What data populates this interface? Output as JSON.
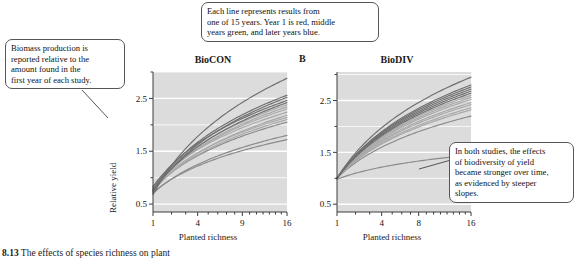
{
  "figure": {
    "caption_number": "8.13",
    "caption_text": "The effects of species richness on plant"
  },
  "callouts": [
    {
      "id": "biomass-note",
      "lines": [
        "Biomass production is",
        "reported relative to the",
        "amount found in the",
        "first year of each study."
      ]
    },
    {
      "id": "line-color-note",
      "lines": [
        "Each line represents results from",
        "one of 15 years. Year 1 is red, middle",
        "years green, and later years blue."
      ]
    },
    {
      "id": "slope-note",
      "lines": [
        "In both studies, the effects",
        "of biodiversity of yield",
        "became stronger over time,",
        "as evidenced by steeper",
        "slopes."
      ]
    }
  ],
  "colors": {
    "panel_background": "#dcdcdc",
    "gridline": "#ffffff",
    "axis": "#3c3c3c",
    "year_early": "#8a8a8a",
    "year_middle": "#a8a8a8",
    "year_late": "#6e6e6e"
  },
  "chart_data": [
    {
      "type": "line",
      "panel_letter": "A",
      "title": "BioCON",
      "xlabel": "Planted richness",
      "ylabel": "Relative yield",
      "x_ticks": [
        1,
        4,
        9,
        16
      ],
      "x_tick_labels": [
        "1",
        "4",
        "9",
        "16"
      ],
      "y_ticks": [
        0.5,
        1.5,
        2.5
      ],
      "y_tick_labels": [
        "0.5",
        "1.5",
        "2.5"
      ],
      "xlim": [
        1,
        16
      ],
      "ylim": [
        0.35,
        3.0
      ],
      "x_scale": "sqrt",
      "grid": true,
      "legend": "none",
      "n_years": 15,
      "series": [
        {
          "name": "Year 1",
          "color_group": "early",
          "y_at_x1": 0.72,
          "y_at_x16": 1.72
        },
        {
          "name": "Year 2",
          "color_group": "early",
          "y_at_x1": 0.7,
          "y_at_x16": 1.8
        },
        {
          "name": "Year 3",
          "color_group": "early",
          "y_at_x1": 0.78,
          "y_at_x16": 2.05
        },
        {
          "name": "Year 4",
          "color_group": "middle",
          "y_at_x1": 0.76,
          "y_at_x16": 2.1
        },
        {
          "name": "Year 5",
          "color_group": "middle",
          "y_at_x1": 0.8,
          "y_at_x16": 2.14
        },
        {
          "name": "Year 6",
          "color_group": "middle",
          "y_at_x1": 0.74,
          "y_at_x16": 2.18
        },
        {
          "name": "Year 7",
          "color_group": "middle",
          "y_at_x1": 0.82,
          "y_at_x16": 2.24
        },
        {
          "name": "Year 8",
          "color_group": "middle",
          "y_at_x1": 0.79,
          "y_at_x16": 2.3
        },
        {
          "name": "Year 9",
          "color_group": "middle",
          "y_at_x1": 0.77,
          "y_at_x16": 2.34
        },
        {
          "name": "Year 10",
          "color_group": "middle",
          "y_at_x1": 0.81,
          "y_at_x16": 2.38
        },
        {
          "name": "Year 11",
          "color_group": "late",
          "y_at_x1": 0.75,
          "y_at_x16": 2.42
        },
        {
          "name": "Year 12",
          "color_group": "late",
          "y_at_x1": 0.83,
          "y_at_x16": 2.46
        },
        {
          "name": "Year 13",
          "color_group": "late",
          "y_at_x1": 0.73,
          "y_at_x16": 2.52
        },
        {
          "name": "Year 14",
          "color_group": "late",
          "y_at_x1": 0.78,
          "y_at_x16": 2.56
        },
        {
          "name": "Year 15",
          "color_group": "late",
          "y_at_x1": 0.68,
          "y_at_x16": 2.88
        }
      ]
    },
    {
      "type": "line",
      "panel_letter": "B",
      "title": "BioDIV",
      "xlabel": "Planted richness",
      "ylabel": "",
      "x_ticks": [
        1,
        4,
        8,
        16
      ],
      "x_tick_labels": [
        "1",
        "4",
        "8",
        "16"
      ],
      "y_ticks": [
        0.5,
        1.5,
        2.5
      ],
      "y_tick_labels": [
        "0.5",
        "1.5",
        "2.5"
      ],
      "xlim": [
        1,
        16
      ],
      "ylim": [
        0.35,
        3.05
      ],
      "x_scale": "sqrt",
      "grid": true,
      "legend": "none",
      "n_years": 15,
      "series": [
        {
          "name": "Year 1",
          "color_group": "early",
          "y_at_x1": 0.98,
          "y_at_x16": 1.45
        },
        {
          "name": "Year 2",
          "color_group": "early",
          "y_at_x1": 1.0,
          "y_at_x16": 2.2
        },
        {
          "name": "Year 3",
          "color_group": "middle",
          "y_at_x1": 1.0,
          "y_at_x16": 2.32
        },
        {
          "name": "Year 4",
          "color_group": "middle",
          "y_at_x1": 1.0,
          "y_at_x16": 2.36
        },
        {
          "name": "Year 5",
          "color_group": "middle",
          "y_at_x1": 1.0,
          "y_at_x16": 2.42
        },
        {
          "name": "Year 6",
          "color_group": "middle",
          "y_at_x1": 1.0,
          "y_at_x16": 2.46
        },
        {
          "name": "Year 7",
          "color_group": "middle",
          "y_at_x1": 1.0,
          "y_at_x16": 2.52
        },
        {
          "name": "Year 8",
          "color_group": "middle",
          "y_at_x1": 1.0,
          "y_at_x16": 2.56
        },
        {
          "name": "Year 9",
          "color_group": "middle",
          "y_at_x1": 1.0,
          "y_at_x16": 2.6
        },
        {
          "name": "Year 10",
          "color_group": "late",
          "y_at_x1": 1.0,
          "y_at_x16": 2.64
        },
        {
          "name": "Year 11",
          "color_group": "late",
          "y_at_x1": 1.0,
          "y_at_x16": 2.68
        },
        {
          "name": "Year 12",
          "color_group": "late",
          "y_at_x1": 1.0,
          "y_at_x16": 2.72
        },
        {
          "name": "Year 13",
          "color_group": "late",
          "y_at_x1": 1.0,
          "y_at_x16": 2.76
        },
        {
          "name": "Year 14",
          "color_group": "late",
          "y_at_x1": 1.0,
          "y_at_x16": 2.8
        },
        {
          "name": "Year 15",
          "color_group": "late",
          "y_at_x1": 1.0,
          "y_at_x16": 2.95
        }
      ]
    }
  ]
}
